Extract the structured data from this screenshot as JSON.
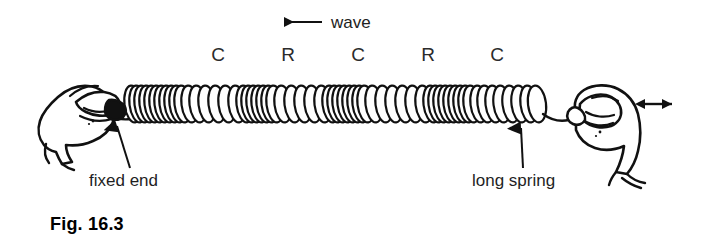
{
  "figure": {
    "caption": "Fig. 16.3",
    "background_color": "#ffffff",
    "ink_color": "#111111"
  },
  "wave": {
    "direction_label": "wave",
    "direction": "leftward",
    "arrow_icon": "left-arrow-icon"
  },
  "zone_labels": [
    {
      "text": "C",
      "meaning": "compression",
      "x": 218
    },
    {
      "text": "R",
      "meaning": "rarefaction",
      "x": 288
    },
    {
      "text": "C",
      "meaning": "compression",
      "x": 358
    },
    {
      "text": "R",
      "meaning": "rarefaction",
      "x": 428
    },
    {
      "text": "C",
      "meaning": "compression",
      "x": 497
    }
  ],
  "callouts": [
    {
      "label": "fixed end",
      "arrow_icon": "up-arrow-icon",
      "points_to": "left-hand-grip"
    },
    {
      "label": "long spring",
      "arrow_icon": "up-arrow-icon",
      "points_to": "spring-coils"
    }
  ],
  "hands": {
    "left": {
      "name": "left-hand-holding-fixed-end",
      "role": "holds spring fixed"
    },
    "right": {
      "name": "right-hand-oscillating",
      "role": "moves spring back and forth",
      "motion_arrow_icon": "double-headed-horizontal-arrow-icon"
    }
  },
  "spring": {
    "name": "long-spring",
    "coil_count": 52,
    "left_end_x": 128,
    "right_end_x": 540,
    "center_y": 104,
    "coil_height": 38,
    "pattern": "alternating compressions and rarefactions"
  }
}
